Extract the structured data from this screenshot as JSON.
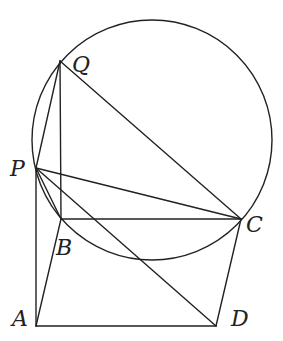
{
  "diagram": {
    "type": "geometry",
    "colors": {
      "stroke": "#222222",
      "background": "#ffffff"
    },
    "points": {
      "Q": {
        "label": "Q",
        "x": 60,
        "y": 61
      },
      "P": {
        "label": "P",
        "x": 36,
        "y": 168
      },
      "B": {
        "label": "B",
        "x": 61,
        "y": 219
      },
      "C": {
        "label": "C",
        "x": 241,
        "y": 219
      },
      "A": {
        "label": "A",
        "x": 36,
        "y": 326
      },
      "D": {
        "label": "D",
        "x": 216,
        "y": 326
      }
    },
    "circle": {
      "cx": 152,
      "cy": 140,
      "r": 120,
      "through": [
        "Q",
        "P",
        "B",
        "C"
      ]
    },
    "segments": [
      [
        "P",
        "Q"
      ],
      [
        "Q",
        "B"
      ],
      [
        "Q",
        "C"
      ],
      [
        "P",
        "C"
      ],
      [
        "P",
        "B"
      ],
      [
        "P",
        "D"
      ],
      [
        "B",
        "C"
      ],
      [
        "P",
        "A"
      ],
      [
        "A",
        "B"
      ],
      [
        "A",
        "D"
      ],
      [
        "C",
        "D"
      ]
    ]
  }
}
